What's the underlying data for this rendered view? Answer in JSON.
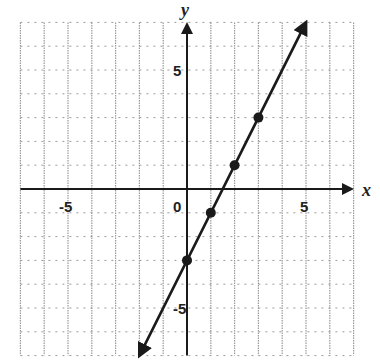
{
  "chart_data": {
    "type": "line",
    "title": "",
    "xlabel": "x",
    "ylabel": "y",
    "xlim": [
      -7,
      7
    ],
    "ylim": [
      -7,
      7
    ],
    "grid": true,
    "x_tick_labels": [
      {
        "value": -5,
        "label": "-5"
      },
      {
        "value": 0,
        "label": "0"
      },
      {
        "value": 5,
        "label": "5"
      }
    ],
    "y_tick_labels": [
      {
        "value": 5,
        "label": "5"
      },
      {
        "value": -5,
        "label": "-5"
      }
    ],
    "series": [
      {
        "name": "y = 2x - 3",
        "equation": "y = 2x - 3",
        "line_endpoints": [
          [
            -2,
            -7
          ],
          [
            5,
            7
          ]
        ],
        "arrows_both_ends": true,
        "points": [
          [
            0,
            -3
          ],
          [
            1,
            -1
          ],
          [
            2,
            1
          ],
          [
            3,
            3
          ]
        ]
      }
    ],
    "colors": {
      "line": "#1a1a1a",
      "grid": "#9a9a9a",
      "axis": "#1a1a1a"
    }
  }
}
